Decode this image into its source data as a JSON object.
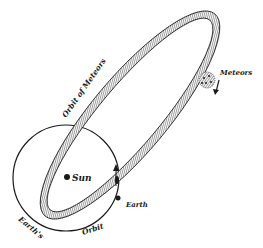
{
  "figure": {
    "type": "engraving-diagram"
  },
  "labels": {
    "sun": "Sun",
    "earth": "Earth",
    "meteors": "Meteors",
    "orbit_of_meteors": "Orbit of Meteors",
    "earths": "Earth's",
    "orbit": "Orbit"
  },
  "colors": {
    "background": "#ffffff",
    "ink": "#1a1a1a",
    "band_fill": "#9a9a9a",
    "band_hatch": "#3a3a3a"
  }
}
